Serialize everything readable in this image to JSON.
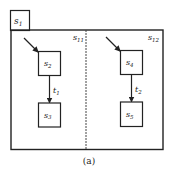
{
  "diagram": {
    "outer_state": {
      "label": "s",
      "sub": "1"
    },
    "regions": [
      {
        "label": "s",
        "sub": "11",
        "states": [
          {
            "label": "s",
            "sub": "2"
          },
          {
            "label": "s",
            "sub": "3"
          }
        ],
        "transition": {
          "label": "t",
          "sub": "1"
        }
      },
      {
        "label": "s",
        "sub": "12",
        "states": [
          {
            "label": "s",
            "sub": "4"
          },
          {
            "label": "s",
            "sub": "5"
          }
        ],
        "transition": {
          "label": "t",
          "sub": "2"
        }
      }
    ],
    "caption": "(a)",
    "colors": {
      "stroke": "#222222",
      "background": "#ffffff"
    }
  }
}
